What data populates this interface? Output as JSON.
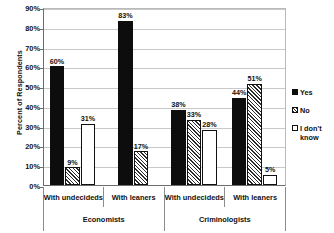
{
  "chart_data": {
    "type": "bar",
    "title": "",
    "xlabel": "",
    "ylabel": "Percent of Respondents",
    "ylim": [
      0,
      90
    ],
    "grid": true,
    "legend_position": "right",
    "categories": [
      "With undecideds",
      "With leaners",
      "With undecideds",
      "With leaners"
    ],
    "groups": [
      {
        "name": "Economists",
        "categories": [
          "With undecideds",
          "With leaners"
        ]
      },
      {
        "name": "Criminologists",
        "categories": [
          "With undecideds",
          "With leaners"
        ]
      }
    ],
    "series": [
      {
        "name": "Yes",
        "values": [
          60,
          83,
          38,
          44
        ],
        "color": "#0d0d0d",
        "pattern": "solid"
      },
      {
        "name": "No",
        "values": [
          9,
          17,
          33,
          51
        ],
        "color": "#2b2b2b",
        "pattern": "hatch"
      },
      {
        "name": "I don't know",
        "values": [
          31,
          null,
          28,
          5
        ],
        "color": "#ffffff",
        "pattern": "empty"
      }
    ],
    "data_labels": [
      {
        "text": "60%",
        "group": 0,
        "series": "Yes"
      },
      {
        "text": "9%",
        "group": 0,
        "series": "No"
      },
      {
        "text": "31%",
        "group": 0,
        "series": "I don't know"
      },
      {
        "text": "83%",
        "group": 1,
        "series": "Yes"
      },
      {
        "text": "17%",
        "group": 1,
        "series": "No"
      },
      {
        "text": "38%",
        "group": 2,
        "series": "Yes"
      },
      {
        "text": "33%",
        "group": 2,
        "series": "No"
      },
      {
        "text": "28%",
        "group": 2,
        "series": "I don't know"
      },
      {
        "text": "44%",
        "group": 3,
        "series": "Yes"
      },
      {
        "text": "51%",
        "group": 3,
        "series": "No"
      },
      {
        "text": "5%",
        "group": 3,
        "series": "I don't know"
      }
    ],
    "ytick_labels": [
      "0%",
      "10%",
      "20%",
      "30%",
      "40%",
      "50%",
      "60%",
      "70%",
      "80%",
      "90%"
    ],
    "ytick_values": [
      0,
      10,
      20,
      30,
      40,
      50,
      60,
      70,
      80,
      90
    ]
  },
  "axis": {
    "y_title": "Percent of Respondents",
    "ticks": [
      {
        "label": "90%",
        "value": 90
      },
      {
        "label": "80%",
        "value": 80
      },
      {
        "label": "70%",
        "value": 70
      },
      {
        "label": "60%",
        "value": 60
      },
      {
        "label": "50%",
        "value": 50
      },
      {
        "label": "40%",
        "value": 40
      },
      {
        "label": "30%",
        "value": 30
      },
      {
        "label": "20%",
        "value": 20
      },
      {
        "label": "10%",
        "value": 10
      },
      {
        "label": "0%",
        "value": 0
      }
    ]
  },
  "xaxis": {
    "level1": [
      {
        "label": "With undecideds"
      },
      {
        "label": "With leaners"
      },
      {
        "label": "With undecideds"
      },
      {
        "label": "With leaners"
      }
    ],
    "level2": [
      {
        "label": "Economists"
      },
      {
        "label": "Criminologists"
      }
    ]
  },
  "legend": {
    "items": [
      {
        "label": "Yes",
        "swatch": "solid-black-square-icon"
      },
      {
        "label": "No",
        "swatch": "hatched-square-icon"
      },
      {
        "label": "I don't know",
        "swatch": "empty-square-icon"
      }
    ]
  },
  "bars": [
    {
      "label": "60%",
      "value": 60,
      "series": "Yes",
      "group": 0
    },
    {
      "label": "9%",
      "value": 9,
      "series": "No",
      "group": 0
    },
    {
      "label": "31%",
      "value": 31,
      "series": "I don't know",
      "group": 0
    },
    {
      "label": "83%",
      "value": 83,
      "series": "Yes",
      "group": 1
    },
    {
      "label": "17%",
      "value": 17,
      "series": "No",
      "group": 1
    },
    {
      "label": "38%",
      "value": 38,
      "series": "Yes",
      "group": 2
    },
    {
      "label": "33%",
      "value": 33,
      "series": "No",
      "group": 2
    },
    {
      "label": "28%",
      "value": 28,
      "series": "I don't know",
      "group": 2
    },
    {
      "label": "44%",
      "value": 44,
      "series": "Yes",
      "group": 3
    },
    {
      "label": "51%",
      "value": 51,
      "series": "No",
      "group": 3
    },
    {
      "label": "5%",
      "value": 5,
      "series": "I don't know",
      "group": 3
    }
  ]
}
